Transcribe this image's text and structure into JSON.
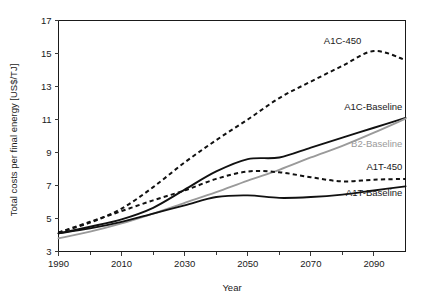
{
  "chart_data": {
    "type": "line",
    "title": "",
    "xlabel": "Year",
    "ylabel": "Total costs per final energy [US$/TJ]",
    "xlim": [
      1990,
      2100
    ],
    "ylim": [
      3,
      17
    ],
    "xticks": [
      1990,
      2010,
      2030,
      2050,
      2070,
      2090
    ],
    "xtick_labels": [
      "1990",
      "2010",
      "2030",
      "2050",
      "2070",
      "2090"
    ],
    "xminorticks": [
      2000,
      2020,
      2040,
      2060,
      2080,
      2100
    ],
    "yticks": [
      3,
      5,
      7,
      9,
      11,
      13,
      15,
      17
    ],
    "ytick_labels": [
      "3",
      "5",
      "7",
      "9",
      "11",
      "13",
      "15",
      "17"
    ],
    "grid": false,
    "legend": "inline-labels",
    "x": [
      1990,
      2000,
      2010,
      2020,
      2030,
      2040,
      2050,
      2060,
      2070,
      2080,
      2090,
      2100
    ],
    "series": [
      {
        "name": "A1C-450",
        "style": "dashed",
        "color": "#111111",
        "label": "A1C-450",
        "label_x": 2086,
        "label_y": 15.55,
        "label_anchor": "end",
        "values": [
          4.15,
          4.75,
          5.6,
          6.9,
          8.4,
          9.75,
          11.0,
          12.3,
          13.3,
          14.25,
          15.15,
          14.6
        ]
      },
      {
        "name": "A1C-Baseline",
        "style": "solid",
        "color": "#111111",
        "label": "A1C-Baseline",
        "label_x": 2099,
        "label_y": 11.55,
        "label_anchor": "end",
        "values": [
          4.1,
          4.5,
          4.95,
          5.65,
          6.75,
          7.85,
          8.6,
          8.7,
          9.3,
          9.9,
          10.5,
          11.1
        ]
      },
      {
        "name": "B2-Baseline",
        "style": "solid",
        "color": "#9a9a9a",
        "label": "B2-Baseline",
        "label_x": 2099,
        "label_y": 9.35,
        "label_anchor": "end",
        "values": [
          3.8,
          4.2,
          4.7,
          5.3,
          5.95,
          6.6,
          7.3,
          7.95,
          8.7,
          9.4,
          10.2,
          11.05
        ]
      },
      {
        "name": "A1T-450",
        "style": "dashed",
        "color": "#111111",
        "label": "A1T-450",
        "label_x": 2099,
        "label_y": 7.95,
        "label_anchor": "end",
        "values": [
          4.15,
          4.8,
          5.45,
          6.1,
          6.7,
          7.4,
          7.85,
          7.8,
          7.5,
          7.25,
          7.35,
          7.4
        ]
      },
      {
        "name": "A1T-Baseline",
        "style": "solid",
        "color": "#111111",
        "label": "A1T-Baseline",
        "label_x": 2099,
        "label_y": 6.35,
        "label_anchor": "end",
        "values": [
          4.1,
          4.4,
          4.8,
          5.3,
          5.8,
          6.3,
          6.4,
          6.25,
          6.3,
          6.45,
          6.7,
          6.95
        ]
      }
    ]
  }
}
